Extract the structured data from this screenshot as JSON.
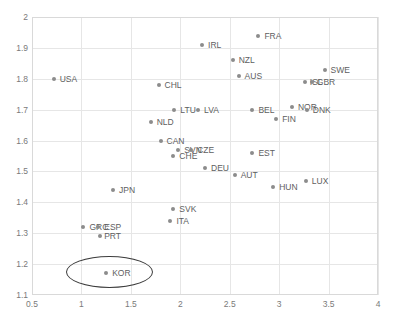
{
  "chart_data": {
    "type": "scatter",
    "title": "",
    "xlabel": "",
    "ylabel": "",
    "xlim": [
      0.5,
      4
    ],
    "ylim": [
      1.1,
      2
    ],
    "grid": true,
    "legend": "none",
    "xticks": [
      "0.5",
      "1",
      "1.5",
      "2",
      "2.5",
      "3",
      "3.5",
      "4"
    ],
    "xtick_values": [
      0.5,
      1,
      1.5,
      2,
      2.5,
      3,
      3.5,
      4
    ],
    "yticks": [
      "1.1",
      "1.2",
      "1.3",
      "1.4",
      "1.5",
      "1.6",
      "1.7",
      "1.8",
      "1.9",
      "2"
    ],
    "ytick_values": [
      1.1,
      1.2,
      1.3,
      1.4,
      1.5,
      1.6,
      1.7,
      1.8,
      1.9,
      2
    ],
    "marker_color": "#8c8c8c",
    "label_color": "#5e5e5e",
    "grid_color": "#e6e6e6",
    "points": [
      {
        "label": "USA",
        "x": 0.72,
        "y": 1.8,
        "lx": 6,
        "ly": 0
      },
      {
        "label": "CHL",
        "x": 1.78,
        "y": 1.78,
        "lx": 6,
        "ly": 0
      },
      {
        "label": "IRL",
        "x": 2.22,
        "y": 1.91,
        "lx": 6,
        "ly": 0
      },
      {
        "label": "FRA",
        "x": 2.79,
        "y": 1.94,
        "lx": 6,
        "ly": 0
      },
      {
        "label": "NZL",
        "x": 2.53,
        "y": 1.86,
        "lx": 6,
        "ly": 0
      },
      {
        "label": "SWE",
        "x": 3.46,
        "y": 1.83,
        "lx": 6,
        "ly": 0
      },
      {
        "label": "AUS",
        "x": 2.59,
        "y": 1.81,
        "lx": 6,
        "ly": 0
      },
      {
        "label": "ISL",
        "x": 3.26,
        "y": 1.79,
        "lx": 5,
        "ly": 0
      },
      {
        "label": "GBR",
        "x": 3.33,
        "y": 1.79,
        "lx": 5,
        "ly": 0
      },
      {
        "label": "LTU",
        "x": 1.94,
        "y": 1.7,
        "lx": 6,
        "ly": 0
      },
      {
        "label": "LVA",
        "x": 2.18,
        "y": 1.7,
        "lx": 6,
        "ly": 0
      },
      {
        "label": "BEL",
        "x": 2.73,
        "y": 1.7,
        "lx": 6,
        "ly": 0
      },
      {
        "label": "NOR",
        "x": 3.13,
        "y": 1.71,
        "lx": 6,
        "ly": 0
      },
      {
        "label": "DNK",
        "x": 3.28,
        "y": 1.7,
        "lx": 6,
        "ly": 0
      },
      {
        "label": "NLD",
        "x": 1.7,
        "y": 1.66,
        "lx": 6,
        "ly": 0
      },
      {
        "label": "FIN",
        "x": 2.97,
        "y": 1.67,
        "lx": 6,
        "ly": 0
      },
      {
        "label": "CAN",
        "x": 1.8,
        "y": 1.6,
        "lx": 6,
        "ly": 0
      },
      {
        "label": "SVN",
        "x": 1.98,
        "y": 1.57,
        "lx": 6,
        "ly": 0
      },
      {
        "label": "CZE",
        "x": 2.11,
        "y": 1.57,
        "lx": 6,
        "ly": 0
      },
      {
        "label": "CHE",
        "x": 1.93,
        "y": 1.55,
        "lx": 6,
        "ly": 0
      },
      {
        "label": "EST",
        "x": 2.73,
        "y": 1.56,
        "lx": 6,
        "ly": 0
      },
      {
        "label": "DEU",
        "x": 2.25,
        "y": 1.51,
        "lx": 6,
        "ly": 0
      },
      {
        "label": "AUT",
        "x": 2.55,
        "y": 1.49,
        "lx": 6,
        "ly": 0
      },
      {
        "label": "LUX",
        "x": 3.27,
        "y": 1.47,
        "lx": 6,
        "ly": 0
      },
      {
        "label": "HUN",
        "x": 2.94,
        "y": 1.45,
        "lx": 6,
        "ly": 0
      },
      {
        "label": "JPN",
        "x": 1.32,
        "y": 1.44,
        "lx": 6,
        "ly": 0
      },
      {
        "label": "SVK",
        "x": 1.93,
        "y": 1.38,
        "lx": 6,
        "ly": 0
      },
      {
        "label": "ITA",
        "x": 1.9,
        "y": 1.34,
        "lx": 6,
        "ly": 0
      },
      {
        "label": "GRC",
        "x": 1.02,
        "y": 1.32,
        "lx": 6,
        "ly": 0
      },
      {
        "label": "ESP",
        "x": 1.17,
        "y": 1.32,
        "lx": 6,
        "ly": 0
      },
      {
        "label": "PRT",
        "x": 1.19,
        "y": 1.29,
        "lx": 4,
        "ly": 0
      },
      {
        "label": "KOR",
        "x": 1.25,
        "y": 1.17,
        "lx": 6,
        "ly": 0
      }
    ],
    "annotations": [
      {
        "kind": "ellipse",
        "name": "kor-highlight-ellipse",
        "cx": 1.28,
        "cy": 1.175,
        "rx": 0.44,
        "ry": 0.052,
        "stroke": "#3c3c3c"
      }
    ]
  }
}
